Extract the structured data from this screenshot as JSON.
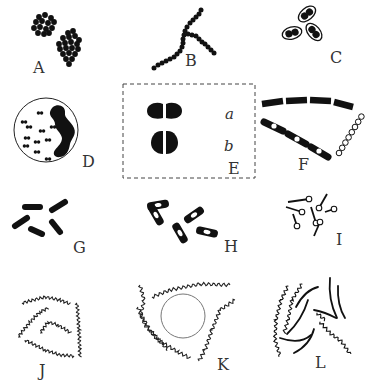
{
  "figure": {
    "ink_color": "#111111",
    "label_color": "#333333",
    "dash_box_color": "#444444",
    "panels": [
      {
        "id": "A",
        "label": "A",
        "subject": "grape-like clusters of cocci"
      },
      {
        "id": "B",
        "label": "B",
        "subject": "branched chain of cocci"
      },
      {
        "id": "C",
        "label": "C",
        "subject": "capsulated diplococci"
      },
      {
        "id": "D",
        "label": "D",
        "subject": "diplococci inside a cell"
      },
      {
        "id": "E",
        "label": "E",
        "subject": "diplococcus pairs",
        "sublabels": [
          "a",
          "b"
        ]
      },
      {
        "id": "F",
        "label": "F",
        "subject": "chains of rods and spore chain"
      },
      {
        "id": "G",
        "label": "G",
        "subject": "scattered rods"
      },
      {
        "id": "H",
        "label": "H",
        "subject": "rods with central spores"
      },
      {
        "id": "I",
        "label": "I",
        "subject": "rods with terminal spores"
      },
      {
        "id": "J",
        "label": "J",
        "subject": "spiral filaments"
      },
      {
        "id": "K",
        "label": "K",
        "subject": "spirals around a cell"
      },
      {
        "id": "L",
        "label": "L",
        "subject": "wavy and curved filaments"
      }
    ]
  }
}
